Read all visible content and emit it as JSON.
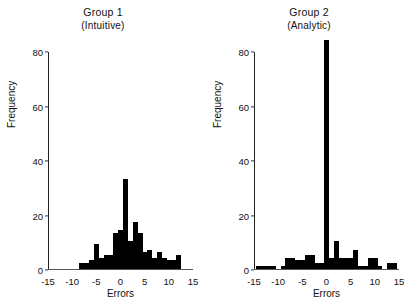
{
  "chart_data": [
    {
      "type": "bar",
      "title": "Group 1",
      "subtitle": "(Intuitive)",
      "xlabel": "Errors",
      "ylabel": "Frequency",
      "xlim": [
        -15,
        15
      ],
      "ylim": [
        0,
        80
      ],
      "xticks": [
        "-15",
        "-10",
        "-5",
        "0",
        "5",
        "10",
        "15"
      ],
      "xtick_values": [
        -15,
        -10,
        -5,
        0,
        5,
        10,
        15
      ],
      "yticks": [
        "0",
        "20",
        "40",
        "60",
        "80"
      ],
      "ytick_values": [
        0,
        20,
        40,
        60,
        80
      ],
      "bin_width": 1,
      "grid": false,
      "legend": "none",
      "bar_color": "#000000",
      "bins": [
        -8.5,
        -7.5,
        -6.5,
        -5.5,
        -4.5,
        -3.5,
        -2.5,
        -1.5,
        -0.5,
        0.5,
        1.5,
        2.5,
        3.5,
        4.5,
        5.5,
        6.5,
        7.5,
        8.5,
        9.5,
        10.5,
        11.5
      ],
      "values": [
        2,
        2,
        3,
        9,
        4,
        5,
        5,
        13,
        14,
        33,
        10,
        17,
        13,
        6,
        7,
        4,
        6,
        4,
        3,
        3,
        5
      ]
    },
    {
      "type": "bar",
      "title": "Group 2",
      "subtitle": "(Analytic)",
      "xlabel": "Errors",
      "ylabel": "Frequency",
      "xlim": [
        -15,
        15
      ],
      "ylim": [
        0,
        80
      ],
      "xticks": [
        "-15",
        "-10",
        "-5",
        "0",
        "5",
        "10",
        "15"
      ],
      "xtick_values": [
        -15,
        -10,
        -5,
        0,
        5,
        10,
        15
      ],
      "yticks": [
        "0",
        "20",
        "40",
        "60",
        "80"
      ],
      "ytick_values": [
        0,
        20,
        40,
        60,
        80
      ],
      "bin_width": 1,
      "grid": false,
      "legend": "none",
      "bar_color": "#000000",
      "bins": [
        -14.5,
        -13.5,
        -12.5,
        -11.5,
        -10.5,
        -9.5,
        -8.5,
        -7.5,
        -6.5,
        -5.5,
        -4.5,
        -3.5,
        -2.5,
        -1.5,
        -0.5,
        0.5,
        1.5,
        2.5,
        3.5,
        4.5,
        5.5,
        6.5,
        7.5,
        8.5,
        9.5,
        10.5,
        11.5,
        12.5,
        13.5
      ],
      "values": [
        1,
        1,
        1,
        1,
        0,
        1,
        4,
        4,
        3,
        3,
        5,
        5,
        2,
        2,
        84,
        4,
        10,
        4,
        4,
        4,
        7,
        1,
        1,
        4,
        4,
        1,
        0,
        2,
        2
      ]
    }
  ]
}
